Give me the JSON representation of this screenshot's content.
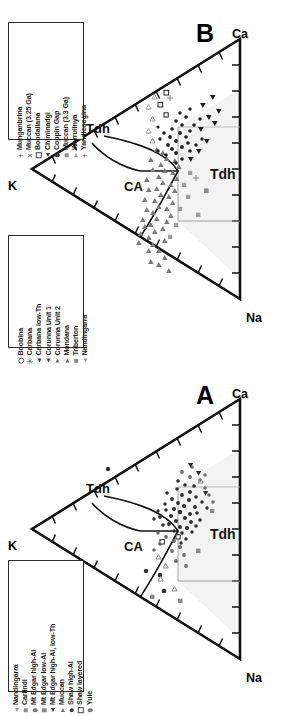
{
  "figure": {
    "panels": [
      {
        "letter": "A",
        "apices": {
          "k": "K",
          "ca": "Ca",
          "na": "Na"
        },
        "fields": {
          "calc_alkaline": "CA",
          "trondhjemite_upper": "Tdh",
          "trondhjemite_lower": "Tdh"
        }
      },
      {
        "letter": "B",
        "apices": {
          "k": "K",
          "ca": "Ca",
          "na": "Na"
        },
        "fields": {
          "calc_alkaline": "CA",
          "trondhjemite_upper": "Tdh",
          "trondhjemite_lower": "Tdh"
        }
      }
    ]
  },
  "legends": [
    {
      "id": "legend-b-right",
      "items": [
        {
          "symbol": "plus",
          "label": "Munganbrina"
        },
        {
          "symbol": "cross",
          "label": "Muccan (3.25 Ga)"
        },
        {
          "symbol": "square-open",
          "label": "Boodaliana"
        },
        {
          "symbol": "triangle-left-filled",
          "label": "Chiminadgi"
        },
        {
          "symbol": "circle-filled",
          "label": "Coppin Gap"
        },
        {
          "symbol": "square-gray",
          "label": "Muccan (3.3 Ga)"
        },
        {
          "symbol": "triangle-right-open",
          "label": "Warrulinya"
        },
        {
          "symbol": "plus",
          "label": "Yandicoogina"
        }
      ]
    },
    {
      "id": "legend-middle",
      "items": [
        {
          "symbol": "circle-open",
          "label": "Boobina"
        },
        {
          "symbol": "star",
          "label": "Carbana"
        },
        {
          "symbol": "triangle-left-filled",
          "label": "Carbana low-Th"
        },
        {
          "symbol": "triangle-left-filled",
          "label": "Corunna Unit 1"
        },
        {
          "symbol": "triangle-right-filled",
          "label": "Corunna Unit 2"
        },
        {
          "symbol": "triangle-right-filled",
          "label": "Mondana"
        },
        {
          "symbol": "square-gray",
          "label": "Triberton"
        },
        {
          "symbol": "triangle-left-open",
          "label": "Nandingarra"
        }
      ]
    },
    {
      "id": "legend-a-left",
      "items": [
        {
          "symbol": "triangle-left-open",
          "label": "Nandingarra"
        },
        {
          "symbol": "square-gray",
          "label": "Carlindi"
        },
        {
          "symbol": "circle-gray",
          "label": "Mt Edgar high-Al"
        },
        {
          "symbol": "square-gray",
          "label": "Mt Edgar low-Al"
        },
        {
          "symbol": "triangle-left-filled",
          "label": "Mt Edgar high-Al, low-Th"
        },
        {
          "symbol": "triangle-right-filled",
          "label": "Muccan"
        },
        {
          "symbol": "circle-filled",
          "label": "Shaw high-Al"
        },
        {
          "symbol": "square-open",
          "label": "Shaw layered"
        },
        {
          "symbol": "circle-gray",
          "label": "Yule"
        }
      ]
    }
  ],
  "chart_data": {
    "type": "scatter",
    "subtype": "ternary",
    "title": "",
    "panels": [
      {
        "name": "A",
        "axes": [
          "Na",
          "K",
          "Ca"
        ],
        "tick_count_per_side": 9,
        "annotations": [
          "CA",
          "Tdh",
          "Tdh"
        ],
        "cluster_center_ternary": {
          "Na": 0.55,
          "K": 0.22,
          "Ca": 0.23
        },
        "n_points_approx": 420
      },
      {
        "name": "B",
        "axes": [
          "Na",
          "K",
          "Ca"
        ],
        "tick_count_per_side": 9,
        "annotations": [
          "CA",
          "Tdh",
          "Tdh"
        ],
        "cluster_center_ternary": {
          "Na": 0.48,
          "K": 0.3,
          "Ca": 0.22
        },
        "n_points_approx": 520
      }
    ],
    "legend_position": "outside-left",
    "grid": false
  },
  "colors": {
    "line": "#1a1a1a",
    "text": "#111111",
    "gray_symbol": "#8a8a8a",
    "dark_symbol": "#3a3a3a",
    "shaded_field": "#f1f1f1"
  }
}
